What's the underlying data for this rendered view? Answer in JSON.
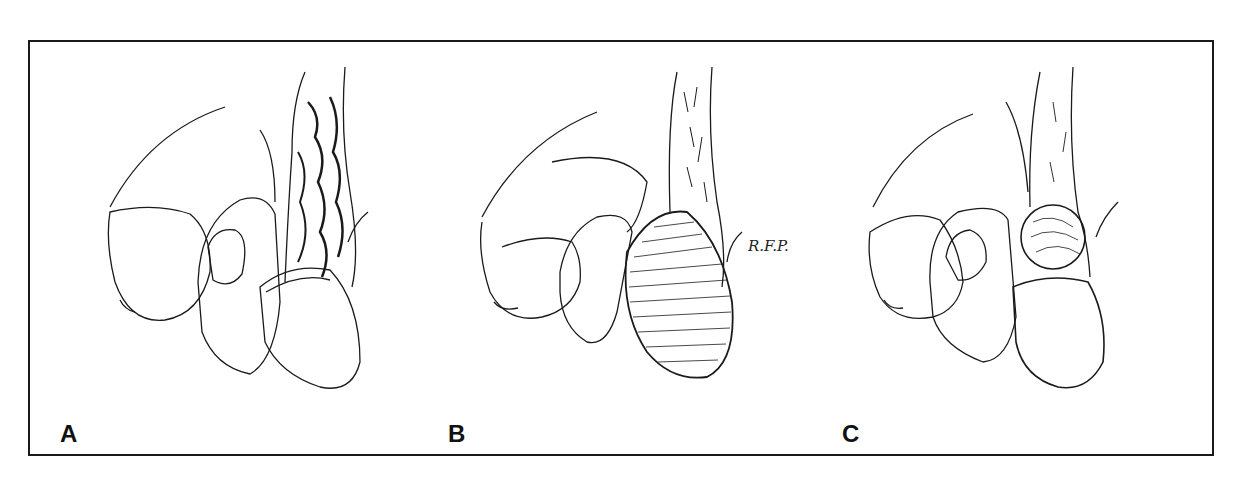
{
  "figure": {
    "panels": [
      {
        "label": "A",
        "description": "Varicocele: dilated tortuous veins of the spermatic cord above the testis"
      },
      {
        "label": "B",
        "description": "Hydrocele: fluid-filled tunica vaginalis enveloping the testis",
        "signature": "R.F.P."
      },
      {
        "label": "C",
        "description": "Spermatocele: cystic mass above the testis at the epididymis"
      }
    ],
    "colors": {
      "line": "#1a1a1a",
      "background": "#ffffff"
    }
  }
}
